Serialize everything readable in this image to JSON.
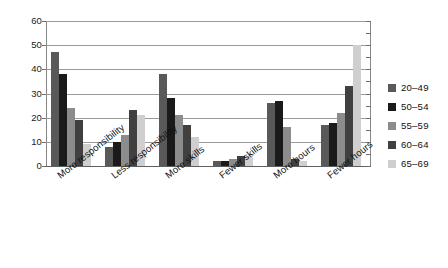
{
  "chart_data": {
    "type": "bar",
    "title": "",
    "subtitle": "",
    "xlabel": "",
    "ylabel": "",
    "ylim": [
      0,
      60
    ],
    "ytick_step": 10,
    "ytick_labels": [
      "0",
      "10",
      "20",
      "30",
      "40",
      "50",
      "60"
    ],
    "grid": true,
    "grid_axis": "y",
    "legend_position": "right",
    "categories": [
      "More responsibility",
      "Less responsibility",
      "More skills",
      "Fewer skills",
      "More hours",
      "Fewer hours"
    ],
    "series": [
      {
        "name": "20–49",
        "color": "#595959",
        "values": [
          47,
          8,
          38,
          2,
          26,
          17
        ]
      },
      {
        "name": "50–54",
        "color": "#1a1a1a",
        "values": [
          38,
          10,
          28,
          2,
          27,
          18
        ]
      },
      {
        "name": "55–59",
        "color": "#8c8c8c",
        "values": [
          24,
          13,
          21,
          3,
          16,
          22
        ]
      },
      {
        "name": "60–64",
        "color": "#404040",
        "values": [
          19,
          23,
          17,
          4,
          3,
          33
        ]
      },
      {
        "name": "65–69",
        "color": "#cfcfcf",
        "values": [
          9,
          21,
          12,
          4,
          2,
          50
        ]
      }
    ]
  },
  "legend": {
    "items": [
      {
        "label": "20–49",
        "color": "#595959"
      },
      {
        "label": "50–54",
        "color": "#1a1a1a"
      },
      {
        "label": "55–59",
        "color": "#8c8c8c"
      },
      {
        "label": "60–64",
        "color": "#404040"
      },
      {
        "label": "65–69",
        "color": "#cfcfcf"
      }
    ]
  },
  "axes": {
    "y_ticks": [
      "0",
      "10",
      "20",
      "30",
      "40",
      "50",
      "60"
    ],
    "x_ticks": [
      "More responsibility",
      "Less responsibility",
      "More skills",
      "Fewer skills",
      "More hours",
      "Fewer hours"
    ]
  },
  "colors": {
    "background": "#ffffff",
    "gridline": "#9a9a9a",
    "axis": "#5f5f5f",
    "text": "#111111"
  }
}
